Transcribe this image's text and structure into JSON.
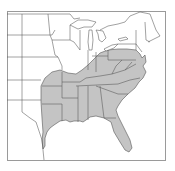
{
  "map": {
    "type": "species-range-map",
    "region": "Eastern United States",
    "colors": {
      "range_fill": "#c4c4c4",
      "background": "#ffffff",
      "border_stroke": "#555555",
      "frame_stroke": "#9a9a9a"
    },
    "shaded_states": [
      "Texas (east)",
      "Oklahoma (east)",
      "Arkansas",
      "Louisiana",
      "Missouri (south)",
      "Illinois (south)",
      "Indiana (south)",
      "Ohio",
      "Kentucky",
      "Tennessee",
      "Mississippi",
      "Alabama",
      "Georgia",
      "Florida",
      "South Carolina",
      "North Carolina",
      "Virginia",
      "West Virginia",
      "Maryland",
      "Delaware",
      "Pennsylvania",
      "New Jersey"
    ],
    "labels": []
  }
}
